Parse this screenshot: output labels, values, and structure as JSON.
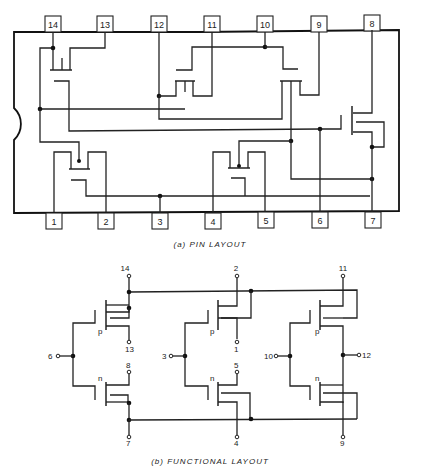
{
  "figure": {
    "pin_layout": {
      "caption": "(a) PIN LAYOUT",
      "top_pins": [
        "14",
        "13",
        "12",
        "11",
        "10",
        "9",
        "8"
      ],
      "bottom_pins": [
        "1",
        "2",
        "3",
        "4",
        "5",
        "6",
        "7"
      ]
    },
    "functional_layout": {
      "caption": "(b) FUNCTIONAL LAYOUT",
      "inverters": [
        {
          "input": "6",
          "output_p": "13",
          "output_n": "8",
          "vdd": "14",
          "vss": "7",
          "p_label": "p",
          "n_label": "n"
        },
        {
          "input": "3",
          "output_p": "1",
          "output_n": "5",
          "vdd": "2",
          "vss": "4",
          "p_label": "p",
          "n_label": "n"
        },
        {
          "input": "10",
          "output": "12",
          "vdd": "11",
          "vss": "9",
          "p_label": "p",
          "n_label": "n"
        }
      ]
    }
  }
}
